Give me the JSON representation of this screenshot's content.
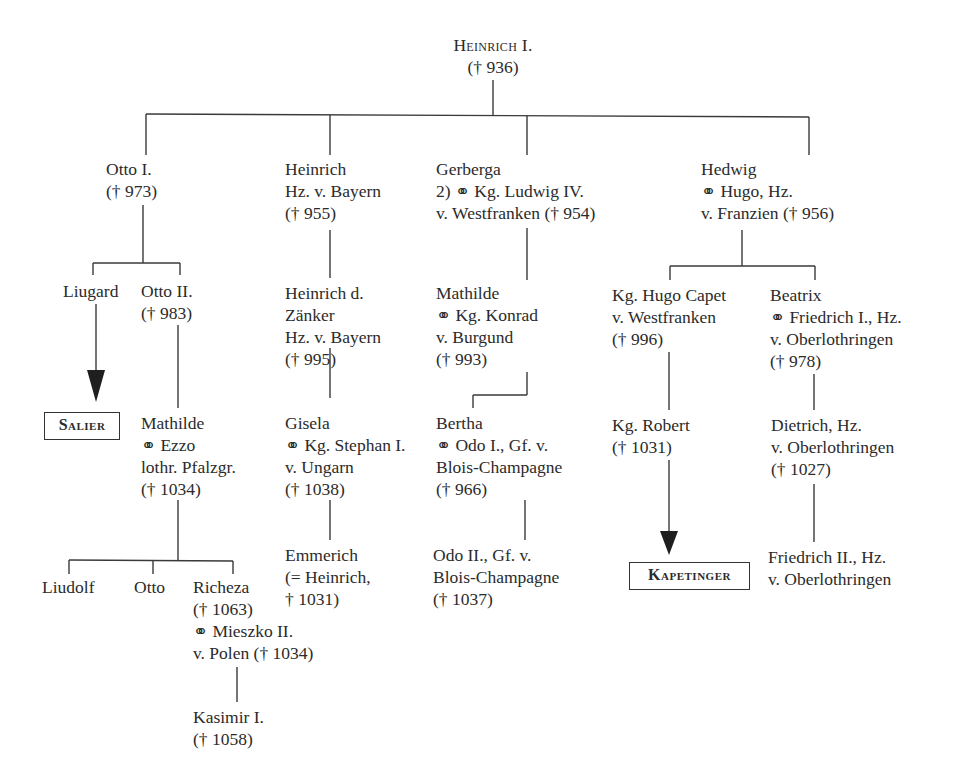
{
  "root": {
    "name": "Heinrich I.",
    "death": "(† 936)"
  },
  "children": {
    "otto1": {
      "lines": [
        "Otto I.",
        "(† 973)"
      ]
    },
    "heinrich_bayern": {
      "lines": [
        "Heinrich",
        "Hz. v. Bayern",
        "(† 955)"
      ]
    },
    "gerberga": {
      "lines": [
        "Gerberga",
        "2) ⚭ Kg. Ludwig IV.",
        "v. Westfranken († 954)"
      ]
    },
    "hedwig": {
      "lines": [
        "Hedwig",
        "⚭ Hugo, Hz.",
        "v. Franzien († 956)"
      ]
    }
  },
  "otto_line": {
    "liugard": {
      "lines": [
        "Liugard"
      ]
    },
    "otto2": {
      "lines": [
        "Otto II.",
        "(† 983)"
      ]
    },
    "salier": {
      "label": "Salier"
    },
    "mathilde": {
      "lines": [
        "Mathilde",
        "⚭ Ezzo",
        "lothr. Pfalzgr.",
        "(† 1034)"
      ]
    },
    "liudolf": {
      "lines": [
        "Liudolf"
      ]
    },
    "otto": {
      "lines": [
        "Otto"
      ]
    },
    "richeza": {
      "lines": [
        "Richeza",
        "(† 1063)",
        "⚭ Mieszko II.",
        "v. Polen († 1034)"
      ]
    },
    "kasimir": {
      "lines": [
        "Kasimir I.",
        "(† 1058)"
      ]
    }
  },
  "bayern_line": {
    "heinrich_zaenker": {
      "lines": [
        "Heinrich d.",
        "Zänker",
        "Hz. v. Bayern",
        "(† 995)"
      ]
    },
    "gisela": {
      "lines": [
        "Gisela",
        "⚭ Kg. Stephan I.",
        "v. Ungarn",
        "(† 1038)"
      ]
    },
    "emmerich": {
      "lines": [
        "Emmerich",
        "(= Heinrich,",
        "† 1031)"
      ]
    }
  },
  "gerberga_line": {
    "mathilde_burgund": {
      "lines": [
        "Mathilde",
        "⚭ Kg. Konrad",
        "v. Burgund",
        "(† 993)"
      ]
    },
    "bertha": {
      "lines": [
        "Bertha",
        "⚭ Odo I., Gf. v.",
        "Blois-Champagne",
        "(† 966)"
      ]
    },
    "odo2": {
      "lines": [
        "Odo II., Gf. v.",
        "Blois-Champagne",
        "(† 1037)"
      ]
    }
  },
  "hedwig_line": {
    "hugo_capet": {
      "lines": [
        "Kg. Hugo Capet",
        "v. Westfranken",
        "(† 996)"
      ]
    },
    "beatrix": {
      "lines": [
        "Beatrix",
        "⚭ Friedrich I., Hz.",
        "v. Oberlothringen",
        "(† 978)"
      ]
    },
    "robert": {
      "lines": [
        "Kg. Robert",
        "(† 1031)"
      ]
    },
    "kapetinger": {
      "label": "Kapetinger"
    },
    "dietrich": {
      "lines": [
        "Dietrich, Hz.",
        "v. Oberlothringen",
        "(† 1027)"
      ]
    },
    "friedrich2": {
      "lines": [
        "Friedrich II., Hz.",
        "v. Oberlothringen"
      ]
    }
  },
  "colors": {
    "line": "#3a3a3a",
    "text": "#2b2b2b",
    "background": "#ffffff"
  }
}
